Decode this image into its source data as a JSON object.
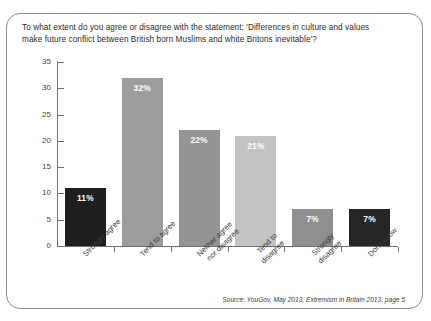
{
  "chart_data": {
    "type": "bar",
    "title": "To what extent do you agree or disagree with the statement: 'Differences in culture and values make future conflict between British born Muslims and white Britons inevitable'?",
    "title_lines": [
      "To what extent do you agree or disagree with the statement: 'Differences in culture and values",
      "make future conflict between British born Muslims and white Britons inevitable'?"
    ],
    "categories": [
      "Strongly agree",
      "Tend to agree",
      "Neither agree nor disagree",
      "Tend to disagree",
      "Strongly disagree",
      "Don't know"
    ],
    "category_lines": [
      [
        "Strongly agree"
      ],
      [
        "Tend to agree"
      ],
      [
        "Neither agree",
        "nor disagree"
      ],
      [
        "Tend to",
        "disagree"
      ],
      [
        "Strongly",
        "disagree"
      ],
      [
        "Don't know"
      ]
    ],
    "values": [
      11,
      32,
      22,
      21,
      7,
      7
    ],
    "data_labels": [
      "11%",
      "32%",
      "22%",
      "21%",
      "7%",
      "7%"
    ],
    "bar_colors": [
      "#1f1f1f",
      "#9d9d9d",
      "#949494",
      "#c3c3c3",
      "#8f8f8f",
      "#262626"
    ],
    "xlabel": "",
    "ylabel": "",
    "ylim": [
      0,
      35
    ],
    "yticks": [
      0,
      5,
      10,
      15,
      20,
      25,
      30,
      35
    ],
    "ytick_labels": [
      "0",
      "5",
      "10",
      "15",
      "20",
      "25",
      "30",
      "35"
    ],
    "grid": false,
    "legend": "none",
    "units": "percent"
  },
  "source": {
    "note": "Source: YouGov, May 2013, Extremism in Britain 2013, page 5"
  }
}
